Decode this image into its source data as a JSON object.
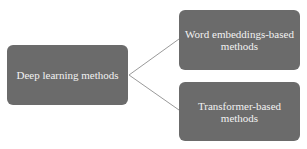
{
  "diagram": {
    "root": {
      "label": "Deep learning methods"
    },
    "children": [
      {
        "label": "Word embeddings-based methods"
      },
      {
        "label": "Transformer-based methods"
      }
    ],
    "colors": {
      "box_fill": "#6b6b6b",
      "text": "#f2f2f2",
      "connector": "#9a9a9a",
      "background": "#ffffff"
    }
  }
}
